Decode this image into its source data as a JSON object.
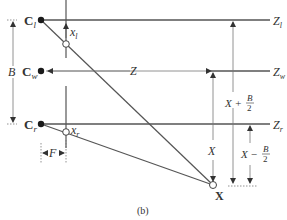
{
  "diagram": {
    "caption": "(b)",
    "cameras": {
      "left": {
        "label": "C",
        "sub": "l"
      },
      "world": {
        "label": "C",
        "sub": "w"
      },
      "right": {
        "label": "C",
        "sub": "r"
      }
    },
    "axes": {
      "zl": {
        "label": "Z",
        "sub": "l"
      },
      "zw": {
        "label": "Z",
        "sub": "w"
      },
      "zr": {
        "label": "Z",
        "sub": "r"
      }
    },
    "image_points": {
      "xl": {
        "label": "x",
        "sub": "l"
      },
      "xr": {
        "label": "x",
        "sub": "r"
      }
    },
    "dimensions": {
      "baseline": "B",
      "depth": "Z",
      "focal": "F",
      "x": "X",
      "x_plus": {
        "main": "X +",
        "num": "B",
        "den": "2"
      },
      "x_minus": {
        "main": "X −",
        "num": "B",
        "den": "2"
      }
    },
    "point": {
      "label": "X"
    },
    "colors": {
      "line": "#555555",
      "thin": "#777777",
      "dot": "#1a1a1a"
    }
  }
}
